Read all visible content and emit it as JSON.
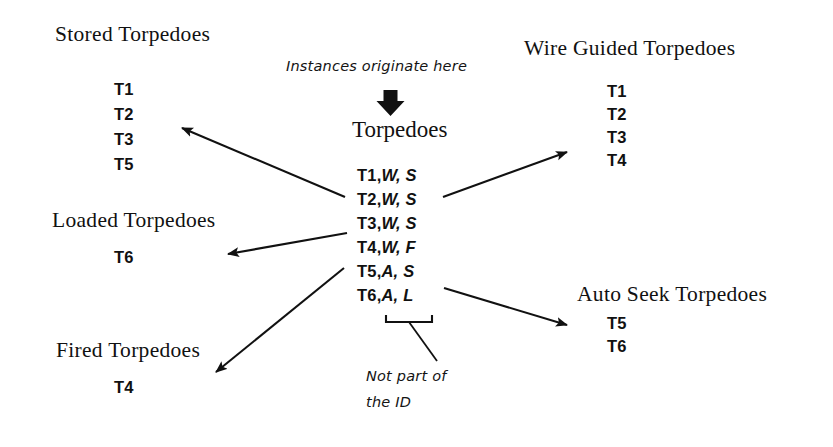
{
  "diagram": {
    "background_color": "#ffffff",
    "ink_color": "#111111"
  },
  "source_entity": {
    "name": "Torpedoes",
    "origin_note": "Instances originate here",
    "down_arrow_icon": "thick-down-arrow-icon",
    "instances": [
      {
        "id": "T1,",
        "attributes": "W, S"
      },
      {
        "id": "T2,",
        "attributes": "W, S"
      },
      {
        "id": "T3,",
        "attributes": "W, S"
      },
      {
        "id": "T4,",
        "attributes": "W, F"
      },
      {
        "id": "T5,",
        "attributes": "A, S"
      },
      {
        "id": "T6,",
        "attributes": "A, L"
      }
    ],
    "brace_note_line1": "Not part of",
    "brace_note_line2": "the ID"
  },
  "subsets": [
    {
      "key": "stored",
      "title": "Stored Torpedoes",
      "members": [
        "T1",
        "T2",
        "T3",
        "T5"
      ]
    },
    {
      "key": "loaded",
      "title": "Loaded Torpedoes",
      "members": [
        "T6"
      ]
    },
    {
      "key": "fired",
      "title": "Fired Torpedoes",
      "members": [
        "T4"
      ]
    },
    {
      "key": "wire_guided",
      "title": "Wire Guided Torpedoes",
      "members": [
        "T1",
        "T2",
        "T3",
        "T4"
      ]
    },
    {
      "key": "auto_seek",
      "title": "Auto Seek Torpedoes",
      "members": [
        "T5",
        "T6"
      ]
    }
  ]
}
